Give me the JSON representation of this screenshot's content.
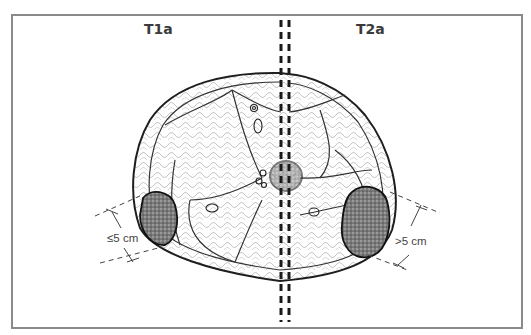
{
  "figure": {
    "left_label": "T1a",
    "right_label": "T2a",
    "left_measure": "≤5 cm",
    "right_measure": ">5 cm",
    "colors": {
      "frame": "#8a8a8a",
      "ink": "#222222",
      "tumor_fill": "#555555",
      "background": "#ffffff"
    }
  }
}
